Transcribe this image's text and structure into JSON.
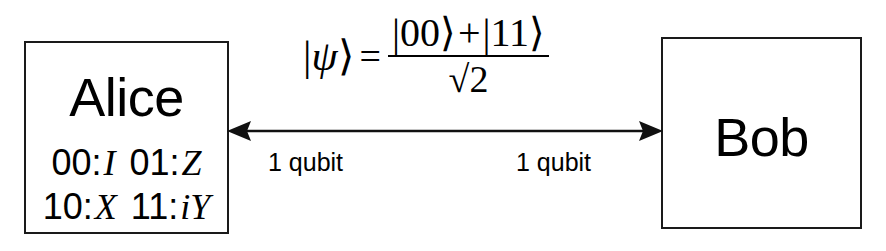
{
  "diagram": {
    "background_color": "#ffffff",
    "stroke_color": "#1a1a1a"
  },
  "alice": {
    "name": "Alice",
    "codes": [
      [
        {
          "bits": "00",
          "colon": ":",
          "operator": "I"
        },
        {
          "bits": "01",
          "colon": ":",
          "operator": "Z"
        }
      ],
      [
        {
          "bits": "10",
          "colon": ":",
          "operator": "X"
        },
        {
          "bits": "11",
          "colon": ":",
          "operator": "iY"
        }
      ]
    ]
  },
  "bob": {
    "name": "Bob"
  },
  "channel": {
    "icon": "double-headed-arrow-icon",
    "left_label": "1 qubit",
    "right_label": "1 qubit"
  },
  "formula": {
    "lhs": "|ψ⟩",
    "lhs_bar": "|",
    "lhs_symbol": "ψ",
    "lhs_ket": "⟩",
    "equals": "=",
    "numerator_left": "|00⟩",
    "numerator_plus": "+",
    "numerator_right": "|11⟩",
    "denominator": "√2",
    "full": "|ψ⟩ = (|00⟩ + |11⟩) / √2"
  }
}
